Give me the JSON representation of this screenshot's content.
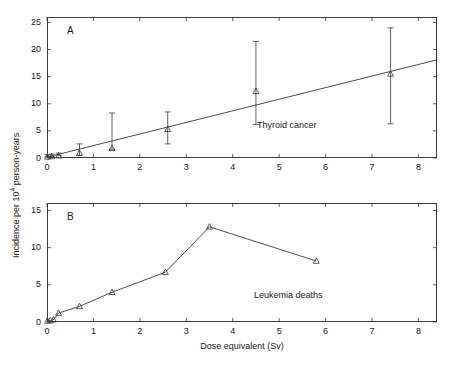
{
  "figure": {
    "xlabel": "Dose equivalent (Sv)",
    "ylabel_prefix": "Incidence per 10",
    "ylabel_exponent": "4",
    "ylabel_suffix": " person-years"
  },
  "chart_data": [
    {
      "type": "scatter",
      "panel": "A",
      "panel_letter": "A",
      "title": "Thyroid cancer",
      "series_label": "Thyroid cancer",
      "xlabel": "Dose equivalent (Sv)",
      "ylabel": "Incidence per 10^4 person-years",
      "xlim": [
        0,
        8.4
      ],
      "ylim": [
        0,
        26
      ],
      "xticks": [
        0,
        1,
        2,
        3,
        4,
        5,
        6,
        7,
        8
      ],
      "yticks": [
        0,
        5,
        10,
        15,
        20,
        25
      ],
      "grid": false,
      "legend": "none",
      "marker": "triangle-open",
      "x": [
        0.01,
        0.1,
        0.25,
        0.7,
        1.4,
        2.6,
        4.5,
        7.4
      ],
      "y": [
        0.2,
        0.3,
        0.45,
        0.9,
        1.8,
        5.3,
        12.3,
        15.5
      ],
      "y_err_low": [
        0.2,
        0.3,
        0.45,
        0.5,
        1.6,
        2.6,
        6.2,
        6.3
      ],
      "y_err_high": [
        0.6,
        0.7,
        0.9,
        2.6,
        8.3,
        8.5,
        21.5,
        24.0
      ],
      "fit_line": {
        "type": "linear",
        "label": "linear fit",
        "x": [
          0.0,
          8.4
        ],
        "y": [
          0.15,
          18.1
        ]
      }
    },
    {
      "type": "line",
      "panel": "B",
      "panel_letter": "B",
      "title": "Leukemia deaths",
      "series_label": "Leukemia deaths",
      "xlabel": "Dose equivalent (Sv)",
      "ylabel": "Incidence per 10^4 person-years",
      "xlim": [
        0,
        8.4
      ],
      "ylim": [
        0,
        16
      ],
      "xticks": [
        0,
        1,
        2,
        3,
        4,
        5,
        6,
        7,
        8
      ],
      "yticks": [
        0,
        5,
        10,
        15
      ],
      "grid": false,
      "legend": "none",
      "marker": "triangle-open",
      "x": [
        0.01,
        0.07,
        0.14,
        0.25,
        0.7,
        1.4,
        2.55,
        3.5,
        5.8
      ],
      "y": [
        0.15,
        0.2,
        0.3,
        1.2,
        2.1,
        4.0,
        6.7,
        12.8,
        8.2
      ]
    }
  ]
}
